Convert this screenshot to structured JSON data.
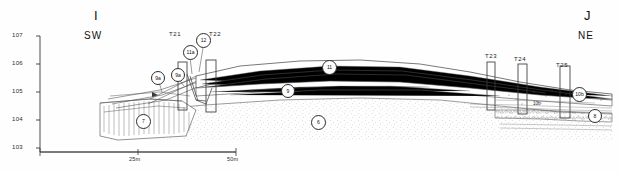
{
  "figure": {
    "type": "archaeological-section-drawing",
    "background_color": "#ffffff",
    "ink_color": "#2b2b2b"
  },
  "axis": {
    "name": "elevation-axis",
    "unit": "m",
    "ticks": [
      "107",
      "106",
      "105",
      "104",
      "103"
    ],
    "tick_values": [
      107,
      106,
      105,
      104,
      103
    ]
  },
  "endpoints": {
    "left": {
      "letter": "I",
      "direction": "SW"
    },
    "right": {
      "letter": "J",
      "direction": "NE"
    }
  },
  "trenches": [
    {
      "label": "T21"
    },
    {
      "label": "T22"
    },
    {
      "label": "T23"
    },
    {
      "label": "T24"
    },
    {
      "label": "T25"
    }
  ],
  "contexts": [
    {
      "label": "7"
    },
    {
      "label": "9a"
    },
    {
      "label": "9a"
    },
    {
      "label": "11a"
    },
    {
      "label": "12"
    },
    {
      "label": "11"
    },
    {
      "label": "9"
    },
    {
      "label": "6"
    },
    {
      "label": "10b"
    },
    {
      "label": "8"
    }
  ],
  "annotations": [
    {
      "label": "10b"
    }
  ],
  "scale_bar": {
    "name": "scale-bar",
    "ticks": [
      "25m",
      "50m"
    ],
    "values": [
      25,
      50
    ]
  }
}
